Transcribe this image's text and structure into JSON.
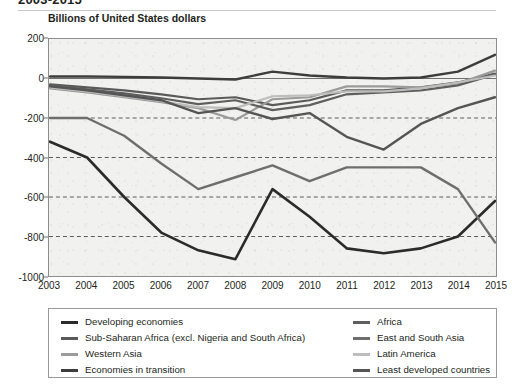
{
  "figure": {
    "title_partial": "2003-2015",
    "unit_caption": "Billions of United States dollars"
  },
  "chart_data": {
    "type": "line",
    "title": "Billions of United States dollars",
    "xlabel": "",
    "ylabel": "Billions of United States dollars",
    "ylim": [
      -1000,
      200
    ],
    "xlim": [
      2003,
      2015
    ],
    "grid": "horizontal-dashed",
    "legend_position": "bottom",
    "yticks": [
      200,
      0,
      -200,
      -400,
      -600,
      -800,
      -1000
    ],
    "categories": [
      2003,
      2004,
      2005,
      2006,
      2007,
      2008,
      2009,
      2010,
      2011,
      2012,
      2013,
      2014,
      2015
    ],
    "series": [
      {
        "name": "Developing economies",
        "color": "#2b2b2b",
        "width": 2.6,
        "values": [
          -320,
          -400,
          -600,
          -780,
          -870,
          -915,
          -560,
          -700,
          -860,
          -885,
          -860,
          -800,
          -620
        ]
      },
      {
        "name": "Sub-Saharan Africa (excl. Nigeria and South Africa)",
        "color": "#5a5a5a",
        "width": 2.2,
        "values": [
          -30,
          -45,
          -60,
          -80,
          -105,
          -95,
          -135,
          -110,
          -60,
          -60,
          -45,
          -20,
          25
        ]
      },
      {
        "name": "Western Asia",
        "color": "#9b9b9b",
        "width": 2.2,
        "values": [
          -50,
          -70,
          -95,
          -120,
          -150,
          -210,
          -105,
          -95,
          -40,
          -40,
          -45,
          -25,
          40
        ]
      },
      {
        "name": "Economies in transition",
        "color": "#3d3d3d",
        "width": 2.4,
        "values": [
          10,
          10,
          8,
          5,
          0,
          -5,
          35,
          15,
          5,
          0,
          5,
          35,
          120
        ]
      },
      {
        "name": "Africa",
        "color": "#5f5f5f",
        "width": 2.2,
        "values": [
          -35,
          -55,
          -75,
          -100,
          -130,
          -110,
          -160,
          -135,
          -80,
          -70,
          -60,
          -35,
          20
        ]
      },
      {
        "name": "East and South Asia",
        "color": "#6e6e6e",
        "width": 2.4,
        "values": [
          -200,
          -200,
          -290,
          -430,
          -560,
          -500,
          -440,
          -520,
          -450,
          -450,
          -450,
          -560,
          -830
        ]
      },
      {
        "name": "Latin America",
        "color": "#bdbdbd",
        "width": 2.2,
        "values": [
          -45,
          -65,
          -90,
          -115,
          -145,
          -150,
          -90,
          -85,
          -65,
          -65,
          -50,
          -20,
          15
        ]
      },
      {
        "name": "Least developed countries",
        "color": "#555555",
        "width": 2.4,
        "values": [
          -40,
          -60,
          -85,
          -110,
          -175,
          -150,
          -205,
          -175,
          -295,
          -360,
          -230,
          -150,
          -95
        ]
      }
    ]
  },
  "axes": {
    "y_ticks": [
      "200",
      "0",
      "-200",
      "-400",
      "-600",
      "-800",
      "-1000"
    ],
    "x_ticks": [
      "2003",
      "2004",
      "2005",
      "2006",
      "2007",
      "2008",
      "2009",
      "2010",
      "2011",
      "2012",
      "2013",
      "2014",
      "2015"
    ]
  },
  "legend": {
    "left_column": [
      {
        "label": "Developing economies",
        "color": "#2b2b2b",
        "thickness": 3
      },
      {
        "label": "Sub-Saharan Africa (excl. Nigeria and South Africa)",
        "color": "#5a5a5a",
        "thickness": 3
      },
      {
        "label": "Western Asia",
        "color": "#9b9b9b",
        "thickness": 3
      },
      {
        "label": "Economies in transition",
        "color": "#3d3d3d",
        "thickness": 3
      }
    ],
    "right_column": [
      {
        "label": "Africa",
        "color": "#5f5f5f",
        "thickness": 3
      },
      {
        "label": "East and South Asia",
        "color": "#6e6e6e",
        "thickness": 3
      },
      {
        "label": "Latin America",
        "color": "#bdbdbd",
        "thickness": 3
      },
      {
        "label": "Least developed countries",
        "color": "#555555",
        "thickness": 3
      }
    ]
  }
}
